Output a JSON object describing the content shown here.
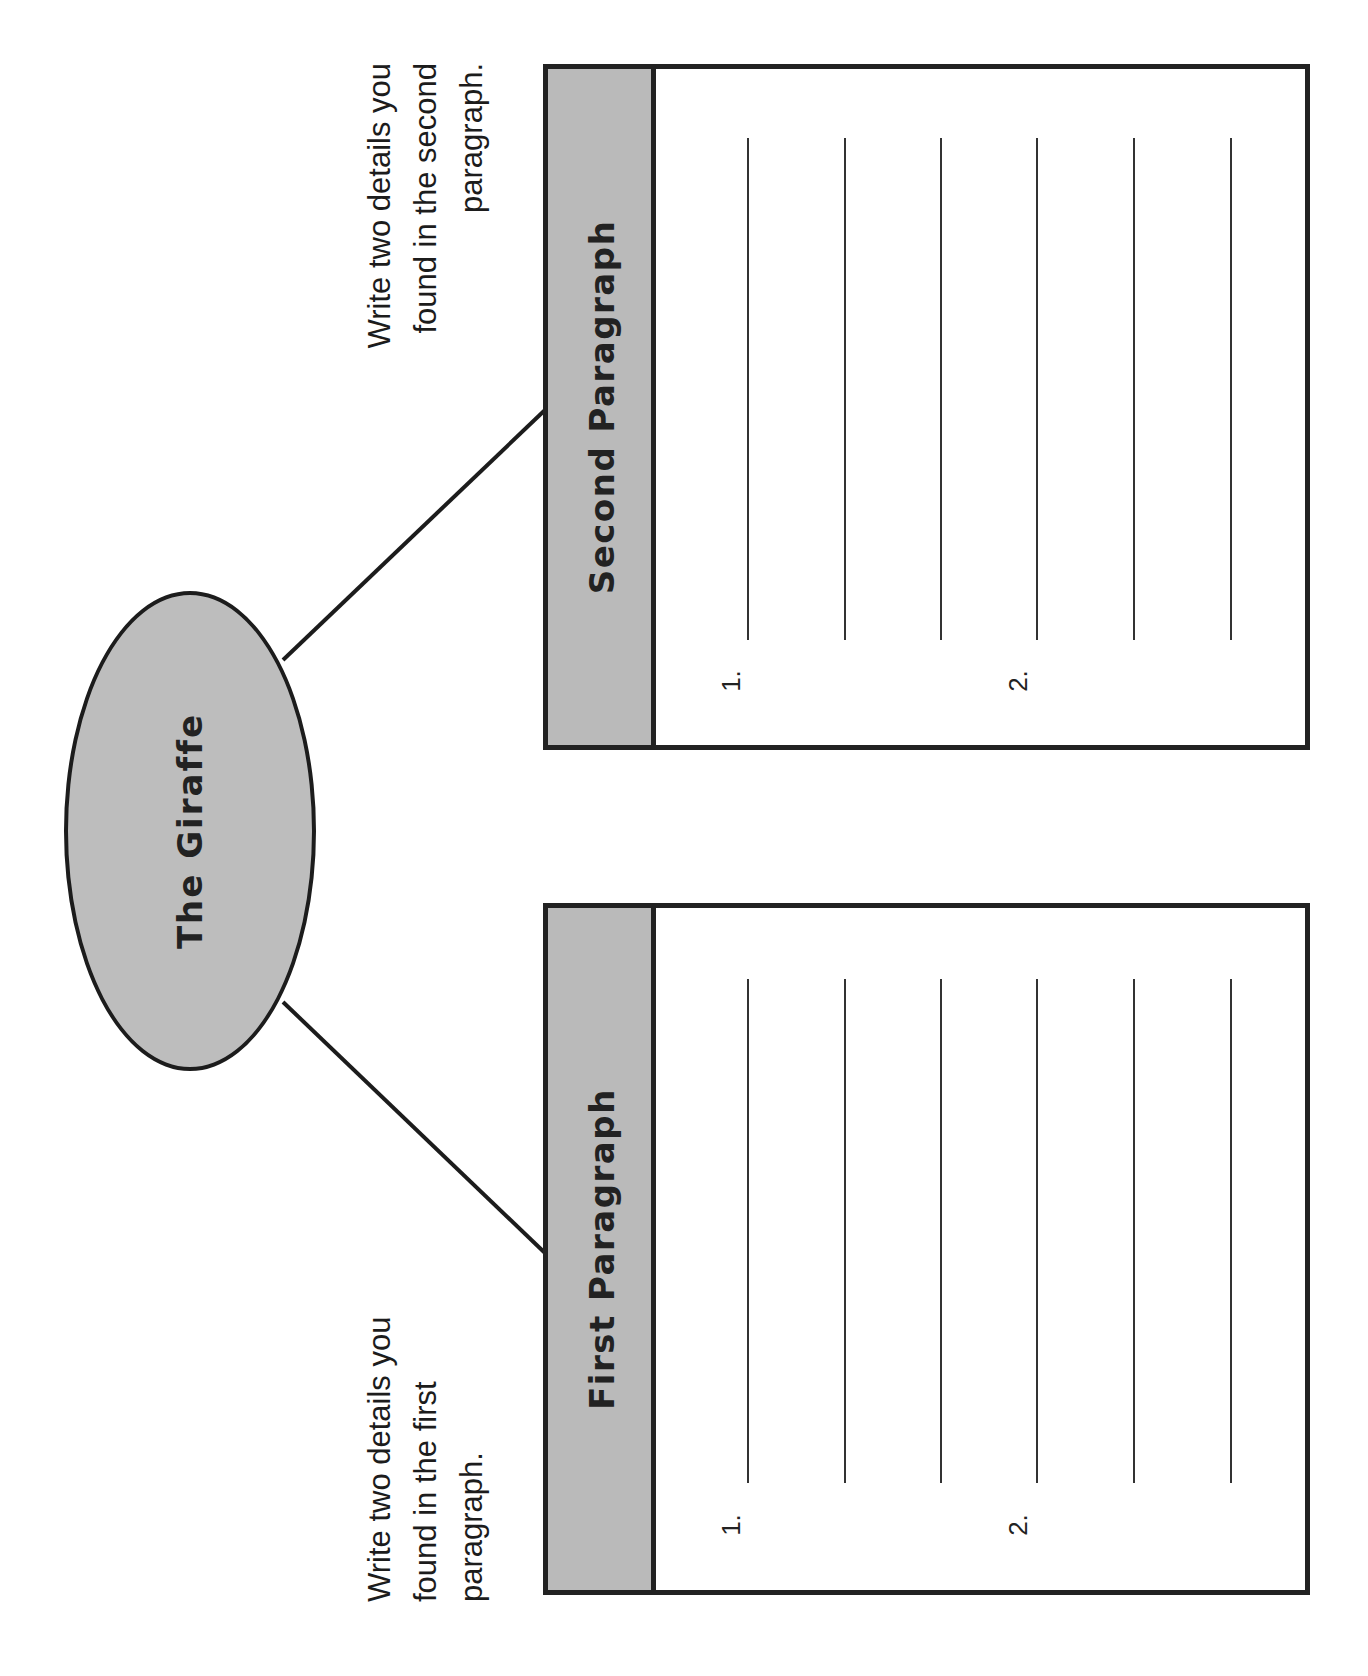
{
  "title": "The Giraffe",
  "boxes": [
    {
      "id": "second",
      "heading": "Second Paragraph",
      "instruction_lines": [
        "Write two details you",
        "found in the second",
        "paragraph."
      ],
      "numbers": [
        "1.",
        "2."
      ],
      "writing_lines": 6
    },
    {
      "id": "first",
      "heading": "First Paragraph",
      "instruction_lines": [
        "Write two details you",
        "found in the first",
        "paragraph."
      ],
      "numbers": [
        "1.",
        "2."
      ],
      "writing_lines": 6
    }
  ],
  "colors": {
    "fill_gray": "#bdbdbd",
    "stroke": "#1c1c1c",
    "background": "#ffffff"
  }
}
